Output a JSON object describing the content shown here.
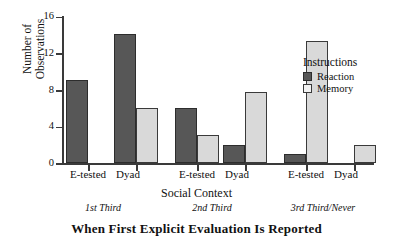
{
  "chart_data": {
    "type": "bar",
    "title": "",
    "xlabel": "Social Context",
    "ylabel": "Number of\nObservations",
    "ylabel_lines": [
      "Number of",
      "Observations"
    ],
    "bottom_label": "When First Explicit Evaluation Is Reported",
    "ylim": [
      0,
      16
    ],
    "yticks": [
      0,
      4,
      8,
      12,
      16
    ],
    "ytick_labels": [
      "0",
      "4",
      "8",
      "12",
      "16"
    ],
    "grid": false,
    "legend": {
      "title": "Instructions",
      "position": "inside-right",
      "entries": [
        {
          "name": "Reaction",
          "color": "#575757"
        },
        {
          "name": "Memory",
          "color": "#d9d9d9"
        }
      ]
    },
    "group_labels": [
      "1st  Third",
      "2nd  Third",
      "3rd  Third/Never"
    ],
    "categories": [
      "E-tested",
      "Dyad",
      "E-tested",
      "Dyad",
      "E-tested",
      "Dyad"
    ],
    "series": [
      {
        "name": "Reaction",
        "color": "#575757",
        "values": [
          9,
          14,
          6,
          2,
          1,
          0
        ]
      },
      {
        "name": "Memory",
        "color": "#d9d9d9",
        "values": [
          0,
          6,
          3,
          7.7,
          13.3,
          2
        ]
      }
    ],
    "groups": [
      {
        "label": "1st  Third",
        "contexts": [
          {
            "label": "E-tested",
            "Reaction": 9,
            "Memory": 0
          },
          {
            "label": "Dyad",
            "Reaction": 14,
            "Memory": 6
          }
        ]
      },
      {
        "label": "2nd  Third",
        "contexts": [
          {
            "label": "E-tested",
            "Reaction": 6,
            "Memory": 3
          },
          {
            "label": "Dyad",
            "Reaction": 2,
            "Memory": 7.7
          }
        ]
      },
      {
        "label": "3rd  Third/Never",
        "contexts": [
          {
            "label": "E-tested",
            "Reaction": 1,
            "Memory": 13.3
          },
          {
            "label": "Dyad",
            "Reaction": 0,
            "Memory": 2
          }
        ]
      }
    ]
  },
  "axis": {
    "y_tick_0": "0",
    "y_tick_4": "4",
    "y_tick_8": "8",
    "y_tick_12": "12",
    "y_tick_16": "16",
    "y_title_line1": "Number of",
    "y_title_line2": "Observations",
    "x_title": "Social Context",
    "bottom_title": "When First Explicit Evaluation Is Reported"
  },
  "cat_labels": {
    "g1c1": "E-tested",
    "g1c2": "Dyad",
    "g2c1": "E-tested",
    "g2c2": "Dyad",
    "g3c1": "E-tested",
    "g3c2": "Dyad"
  },
  "group_labels": {
    "g1": "1st  Third",
    "g2": "2nd  Third",
    "g3": "3rd  Third/Never"
  },
  "legend": {
    "title": "Instructions",
    "reaction": "Reaction",
    "memory": "Memory"
  }
}
